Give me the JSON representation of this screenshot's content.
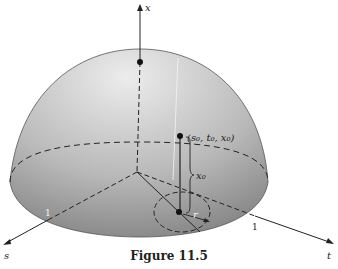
{
  "figure": {
    "caption": "Figure 11.5",
    "axes": {
      "vertical_label": "x",
      "left_label": "s",
      "right_label": "t"
    },
    "tick_labels": {
      "s_tick": "1",
      "t_tick": "1"
    },
    "annotations": {
      "point_label": "(s₀, t₀, x₀)",
      "height_label": "x₀",
      "radius_label": "r"
    },
    "colors": {
      "dome_light": "#e6e6e6",
      "dome_dark": "#8a8a8a",
      "lines": "#222222"
    }
  }
}
